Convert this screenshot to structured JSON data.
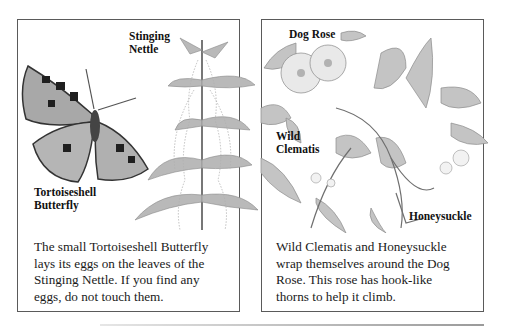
{
  "panels": {
    "left": {
      "labels": {
        "nettle": [
          "Stinging",
          "Nettle"
        ],
        "butterfly": [
          "Tortoiseshell",
          "Butterfly"
        ]
      },
      "caption": [
        "The small Tortoiseshell Butterfly",
        "lays its eggs on the leaves of the",
        "Stinging Nettle. If you find any",
        "eggs, do not touch them."
      ]
    },
    "right": {
      "labels": {
        "rose": "Dog Rose",
        "clematis": [
          "Wild",
          "Clematis"
        ],
        "honeysuckle": "Honeysuckle"
      },
      "caption": [
        "Wild Clematis and Honeysuckle",
        "wrap themselves around the Dog",
        "Rose. This rose has hook-like",
        "thorns to help it climb."
      ]
    }
  },
  "illustrations": {
    "left": [
      "tortoiseshell-butterfly",
      "stinging-nettle"
    ],
    "right": [
      "dog-rose",
      "wild-clematis",
      "honeysuckle"
    ]
  },
  "colors": {
    "border": "#5a5a5a",
    "text": "#1a1a1a",
    "art_gray": "#9a9a9a"
  }
}
